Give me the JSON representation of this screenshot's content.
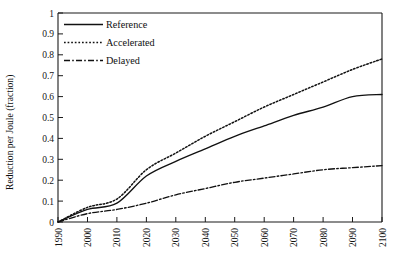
{
  "chart_data": {
    "type": "line",
    "title": "",
    "xlabel": "",
    "ylabel": "Reduction per Joule (fraction)",
    "xlim": [
      1990,
      2100
    ],
    "ylim": [
      0,
      1
    ],
    "grid": false,
    "legend_position": "top-left",
    "xticks": [
      1990,
      2000,
      2010,
      2020,
      2030,
      2040,
      2050,
      2060,
      2070,
      2080,
      2090,
      2100
    ],
    "xtick_labels": [
      "1990",
      "2000",
      "2010",
      "2020",
      "2030",
      "2040",
      "2050",
      "2060",
      "2070",
      "2080",
      "2090",
      "2100"
    ],
    "yticks": [
      0,
      0.1,
      0.2,
      0.3,
      0.4,
      0.5,
      0.6,
      0.7,
      0.8,
      0.9,
      1
    ],
    "ytick_labels": [
      "0",
      "0.1",
      "0.2",
      "0.3",
      "0.4",
      "0.5",
      "0.6",
      "0.7",
      "0.8",
      "0.9",
      "1"
    ],
    "x": [
      1990,
      2000,
      2010,
      2020,
      2030,
      2040,
      2050,
      2060,
      2070,
      2080,
      2090,
      2100
    ],
    "series": [
      {
        "name": "Reference",
        "style": "solid",
        "color": "#111111",
        "values": [
          0,
          0.06,
          0.09,
          0.22,
          0.29,
          0.35,
          0.41,
          0.46,
          0.51,
          0.55,
          0.6,
          0.61
        ]
      },
      {
        "name": "Accelerated",
        "style": "dotted",
        "color": "#111111",
        "values": [
          0,
          0.07,
          0.11,
          0.25,
          0.33,
          0.41,
          0.48,
          0.55,
          0.61,
          0.67,
          0.73,
          0.78
        ]
      },
      {
        "name": "Delayed",
        "style": "dash-dot",
        "color": "#111111",
        "values": [
          0,
          0.04,
          0.06,
          0.09,
          0.13,
          0.16,
          0.19,
          0.21,
          0.23,
          0.25,
          0.26,
          0.27
        ]
      }
    ]
  },
  "legend": {
    "items": [
      {
        "label": "Reference",
        "style": "solid"
      },
      {
        "label": "Accelerated",
        "style": "dotted"
      },
      {
        "label": "Delayed",
        "style": "dash-dot"
      }
    ]
  },
  "axes": {
    "y_title": "Reduction per Joule (fraction)"
  }
}
